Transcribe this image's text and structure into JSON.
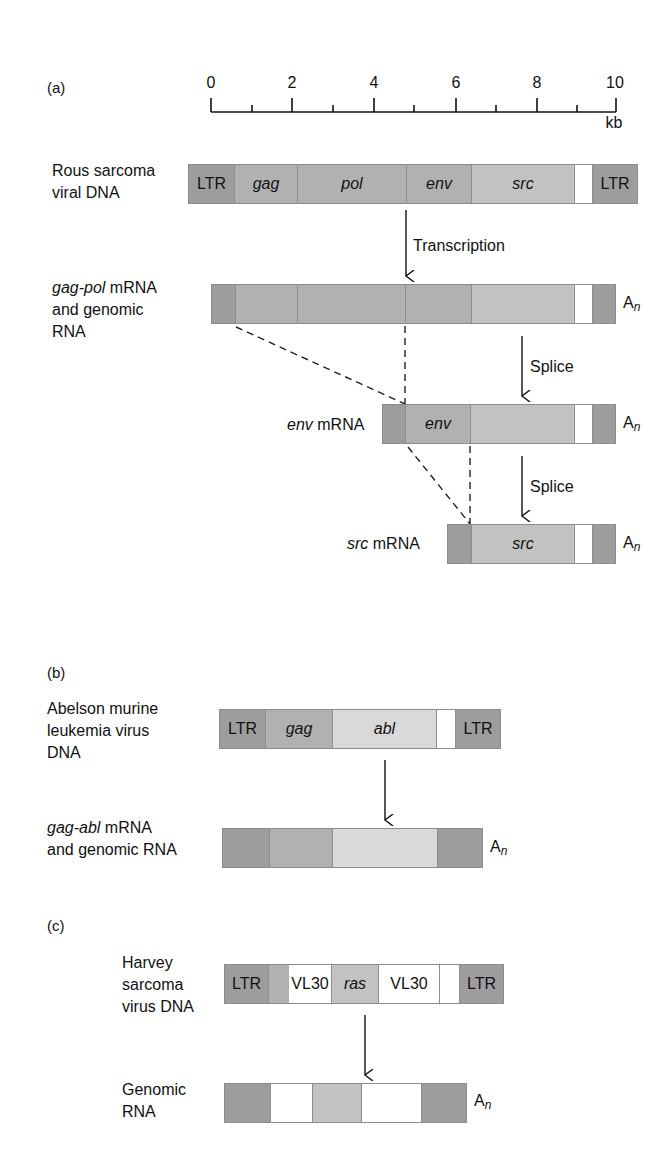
{
  "panels": {
    "a": {
      "label": "(a)",
      "scale": {
        "unit": "kb",
        "ticks": [
          "0",
          "2",
          "4",
          "6",
          "8",
          "10"
        ]
      },
      "rsv_dna": {
        "label_lines": [
          "Rous sarcoma",
          "viral DNA"
        ],
        "segments": [
          "LTR",
          "gag",
          "pol",
          "env",
          "src",
          "",
          "LTR"
        ]
      },
      "transcription_label": "Transcription",
      "gag_pol_mrna": {
        "label_italic": "gag-pol",
        "label_rest": " mRNA",
        "label_lines": [
          "and genomic",
          "RNA"
        ],
        "poly_a": "A",
        "poly_a_sub": "n"
      },
      "splice_label_1": "Splice",
      "env_mrna": {
        "label_italic": "env",
        "label_rest": " mRNA",
        "segment_label": "env",
        "poly_a": "A",
        "poly_a_sub": "n"
      },
      "splice_label_2": "Splice",
      "src_mrna": {
        "label_italic": "src",
        "label_rest": " mRNA",
        "segment_label": "src",
        "poly_a": "A",
        "poly_a_sub": "n"
      }
    },
    "b": {
      "label": "(b)",
      "abelson_dna": {
        "label_lines": [
          "Abelson murine",
          "leukemia virus",
          "DNA"
        ],
        "segments": [
          "LTR",
          "gag",
          "abl",
          "",
          "LTR"
        ]
      },
      "gag_abl_mrna": {
        "label_italic": "gag-abl",
        "label_rest": " mRNA",
        "label_lines": [
          "and genomic RNA"
        ],
        "poly_a": "A",
        "poly_a_sub": "n"
      }
    },
    "c": {
      "label": "(c)",
      "harvey_dna": {
        "label_lines": [
          "Harvey",
          "sarcoma",
          "virus DNA"
        ],
        "segments": [
          "LTR",
          "",
          "VL30",
          "ras",
          "VL30",
          "",
          "LTR"
        ]
      },
      "genomic_rna": {
        "label_lines": [
          "Genomic",
          "RNA"
        ],
        "poly_a": "A",
        "poly_a_sub": "n"
      }
    }
  }
}
